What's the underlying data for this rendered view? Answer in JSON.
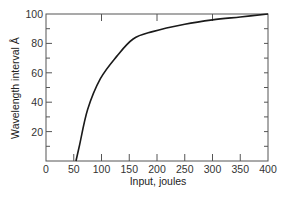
{
  "chart_data": {
    "type": "line",
    "title": "",
    "xlabel": "Input, joules",
    "ylabel": "Wavelength interval Å",
    "xlim": [
      0,
      400
    ],
    "ylim": [
      0,
      100
    ],
    "x_ticks": [
      0,
      50,
      100,
      150,
      200,
      250,
      300,
      350,
      400
    ],
    "y_ticks": [
      20,
      40,
      60,
      80,
      100
    ],
    "y_tick_labels_shown": [
      "20",
      "40",
      "60",
      "80",
      "100"
    ],
    "grid": false,
    "legend": null,
    "series": [
      {
        "name": "Wavelength interval",
        "x": [
          54,
          60,
          75,
          98,
          127,
          157,
          192,
          250,
          300,
          350,
          400
        ],
        "y": [
          0,
          10,
          35,
          56,
          71,
          83,
          88,
          93,
          96,
          98,
          100
        ]
      }
    ]
  }
}
